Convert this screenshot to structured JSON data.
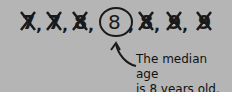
{
  "diagram": {
    "values": [
      "7",
      "7",
      "8",
      "8",
      "8",
      "9",
      "9"
    ],
    "median_index": 3,
    "separator": ",",
    "caption_line1": "The median age",
    "caption_line2": "is 8 years old.",
    "colors": {
      "background": "#b5b5b5",
      "ink": "#1a1a1a"
    },
    "icons": {
      "crossed_out": "x-mark-icon",
      "median_marker": "circle-icon",
      "pointer": "curved-arrow-icon"
    }
  }
}
